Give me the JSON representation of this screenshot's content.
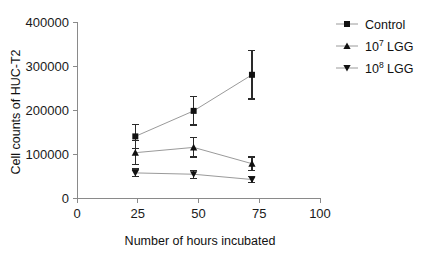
{
  "chart_data": {
    "type": "line",
    "title": "",
    "subtitle": "",
    "xlabel": "Number of hours incubated",
    "ylabel": "Cell counts of HUC-T2",
    "xlim": [
      0,
      100
    ],
    "ylim": [
      0,
      400000
    ],
    "xticks": [
      "0",
      "25",
      "50",
      "75",
      "100"
    ],
    "xtick_values": [
      0,
      25,
      50,
      75,
      100
    ],
    "yticks": [
      "0",
      "100000",
      "200000",
      "300000",
      "400000"
    ],
    "ytick_values": [
      0,
      100000,
      200000,
      300000,
      400000
    ],
    "grid": false,
    "legend_position": "right",
    "x": [
      24,
      48,
      72
    ],
    "series": [
      {
        "name": "Control",
        "marker": "square",
        "values": [
          140000,
          198000,
          280000
        ],
        "errors": [
          27000,
          32000,
          55000
        ]
      },
      {
        "name": "10^7 LGG",
        "name_base": "10",
        "name_exponent": "7",
        "name_suffix": " LGG",
        "marker": "triangle-up",
        "values": [
          103000,
          115000,
          78000
        ],
        "errors": [
          27000,
          22000,
          15000
        ]
      },
      {
        "name": "10^8 LGG",
        "name_base": "10",
        "name_exponent": "8",
        "name_suffix": " LGG",
        "marker": "triangle-down",
        "values": [
          57000,
          54000,
          42000
        ],
        "errors": [
          9000,
          9000,
          7000
        ]
      }
    ],
    "colors": {
      "marker": "#111111",
      "line": "#9a9a9a",
      "axis": "#8a8a8a",
      "error_bar": "#2a2a2a",
      "background": "#ffffff"
    }
  }
}
